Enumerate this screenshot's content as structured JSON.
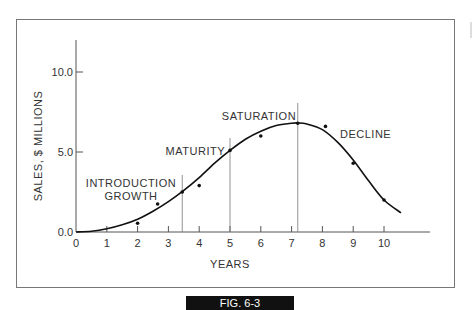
{
  "figure": {
    "caption": "FIG. 6-3"
  },
  "chart_data": {
    "type": "line",
    "title": "",
    "xlabel": "YEARS",
    "ylabel": "SALES, $ MILLIONS",
    "xlim": [
      0,
      11.5
    ],
    "ylim": [
      0,
      12
    ],
    "x_ticks": [
      "0",
      "1",
      "2",
      "3",
      "4",
      "5",
      "6",
      "7",
      "8",
      "9",
      "10"
    ],
    "y_ticks": [
      "0.0",
      "5.0",
      "10.0"
    ],
    "grid": false,
    "legend": "none",
    "series": [
      {
        "name": "Observed sales",
        "kind": "scatter",
        "x": [
          2.0,
          2.65,
          3.45,
          4.0,
          5.0,
          6.0,
          7.2,
          8.1,
          9.0,
          10.0
        ],
        "y": [
          0.55,
          1.75,
          2.5,
          2.9,
          5.1,
          6.0,
          6.8,
          6.6,
          4.3,
          2.0
        ]
      },
      {
        "name": "Product life cycle curve",
        "kind": "line",
        "x": [
          0,
          0.5,
          1,
          1.5,
          2,
          2.5,
          3,
          3.5,
          4,
          4.5,
          5,
          5.5,
          6,
          6.5,
          7,
          7.2,
          7.5,
          8,
          8.5,
          9,
          9.5,
          10,
          10.55
        ],
        "y": [
          0,
          0.05,
          0.2,
          0.45,
          0.8,
          1.3,
          1.9,
          2.6,
          3.4,
          4.3,
          5.1,
          5.8,
          6.3,
          6.65,
          6.8,
          6.82,
          6.75,
          6.4,
          5.6,
          4.5,
          3.2,
          2.0,
          1.2
        ]
      }
    ],
    "stage_dividers": [
      3.45,
      5.0,
      7.2
    ],
    "annotations": [
      {
        "text": "INTRODUCTION",
        "x": 1.5,
        "y": 3.1
      },
      {
        "text": "GROWTH",
        "x": 1.8,
        "y": 2.3
      },
      {
        "text": "MATURITY",
        "x": 4.2,
        "y": 5.1
      },
      {
        "text": "SATURATION",
        "x": 6.2,
        "y": 7.3
      },
      {
        "text": "DECLINE",
        "x": 8.7,
        "y": 6.2
      }
    ]
  }
}
